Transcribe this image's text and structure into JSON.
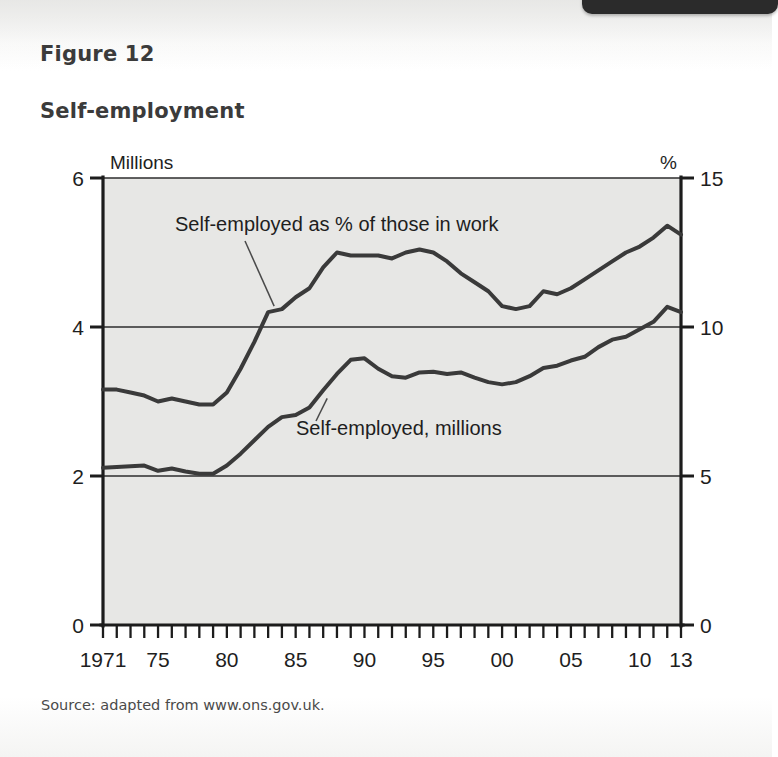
{
  "page": {
    "figure_label": "Figure 12",
    "figure_title": "Self-employment",
    "source_note": "Source: adapted from www.ons.gov.uk.",
    "tab_text": "",
    "colors": {
      "plot_background": "#e7e7e5",
      "line": "#3a3a3a",
      "axis": "#1c1c1c",
      "text": "#1e1e1e",
      "tab": "#2b2b2b"
    }
  },
  "chart_data": {
    "type": "line",
    "title": "Self-employment",
    "xlabel": "",
    "ylabel": "Millions",
    "y2label": "%",
    "ylim": [
      0,
      6
    ],
    "y2lim": [
      0,
      15
    ],
    "xlim": [
      1971,
      2013
    ],
    "grid": true,
    "legend": "annotations-inline",
    "left_axis_unit": "Millions",
    "right_axis_unit": "%",
    "left_ticks": [
      "0",
      "2",
      "4",
      "6"
    ],
    "left_tick_values": [
      0,
      2,
      4,
      6
    ],
    "right_ticks": [
      "0",
      "5",
      "10",
      "15"
    ],
    "right_tick_values": [
      0,
      5,
      10,
      15
    ],
    "x_tick_labels": [
      "1971",
      "75",
      "80",
      "85",
      "90",
      "95",
      "00",
      "05",
      "10",
      "13"
    ],
    "x_tick_years": [
      1971,
      1975,
      1980,
      1985,
      1990,
      1995,
      2000,
      2005,
      2010,
      2013
    ],
    "x_minor_tick_interval_years": 1,
    "annotations": [
      {
        "text": "Self-employed as % of those in work",
        "points_to_series": "Self-employed as % of those in work",
        "points_to_year": 1983
      },
      {
        "text": "Self-employed, millions",
        "points_to_series": "Self-employed, millions",
        "points_to_year": 1987
      }
    ],
    "x": [
      1971,
      1972,
      1973,
      1974,
      1975,
      1976,
      1977,
      1978,
      1979,
      1980,
      1981,
      1982,
      1983,
      1984,
      1985,
      1986,
      1987,
      1988,
      1989,
      1990,
      1991,
      1992,
      1993,
      1994,
      1995,
      1996,
      1997,
      1998,
      1999,
      2000,
      2001,
      2002,
      2003,
      2004,
      2005,
      2006,
      2007,
      2008,
      2009,
      2010,
      2011,
      2012,
      2013
    ],
    "series": [
      {
        "name": "Self-employed as % of those in work",
        "axis": "right",
        "unit": "%",
        "values": [
          7.9,
          7.9,
          7.8,
          7.7,
          7.5,
          7.6,
          7.5,
          7.4,
          7.4,
          7.8,
          8.6,
          9.5,
          10.5,
          10.6,
          11.0,
          11.3,
          12.0,
          12.5,
          12.4,
          12.4,
          12.4,
          12.3,
          12.5,
          12.6,
          12.5,
          12.2,
          11.8,
          11.5,
          11.2,
          10.7,
          10.6,
          10.7,
          11.2,
          11.1,
          11.3,
          11.6,
          11.9,
          12.2,
          12.5,
          12.7,
          13.0,
          13.4,
          13.1
        ]
      },
      {
        "name": "Self-employed, millions",
        "axis": "left",
        "unit": "millions",
        "values": [
          2.11,
          2.12,
          2.13,
          2.14,
          2.07,
          2.1,
          2.06,
          2.03,
          2.03,
          2.14,
          2.3,
          2.48,
          2.66,
          2.79,
          2.82,
          2.92,
          3.15,
          3.37,
          3.56,
          3.58,
          3.44,
          3.34,
          3.32,
          3.39,
          3.4,
          3.37,
          3.39,
          3.32,
          3.26,
          3.23,
          3.26,
          3.34,
          3.45,
          3.48,
          3.55,
          3.6,
          3.73,
          3.83,
          3.87,
          3.97,
          4.07,
          4.27,
          4.2
        ]
      }
    ]
  }
}
